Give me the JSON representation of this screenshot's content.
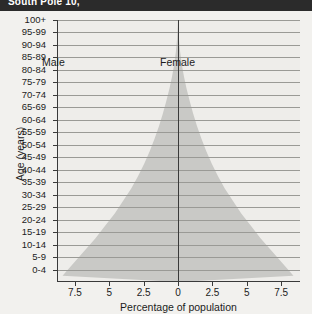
{
  "header": {
    "title": "South Pole 10,"
  },
  "chart_data": {
    "type": "bar",
    "subtype": "population-pyramid",
    "title": "",
    "xlabel": "Percentage of population",
    "ylabel": "Age (years)",
    "categories": [
      "0-4",
      "5-9",
      "10-14",
      "15-19",
      "20-24",
      "25-29",
      "30-34",
      "35-39",
      "40-44",
      "45-49",
      "50-54",
      "55-59",
      "60-64",
      "65-69",
      "70-74",
      "75-79",
      "80-84",
      "85-89",
      "90-94",
      "95-99",
      "100+"
    ],
    "series": [
      {
        "name": "Male",
        "side": "left",
        "values": [
          8.4,
          7.6,
          6.8,
          6.0,
          5.3,
          4.6,
          4.0,
          3.4,
          2.9,
          2.45,
          2.05,
          1.7,
          1.38,
          1.1,
          0.85,
          0.62,
          0.43,
          0.27,
          0.15,
          0.07,
          0.02
        ]
      },
      {
        "name": "Female",
        "side": "right",
        "values": [
          8.4,
          7.6,
          6.8,
          6.0,
          5.3,
          4.6,
          4.0,
          3.4,
          2.9,
          2.45,
          2.05,
          1.7,
          1.38,
          1.1,
          0.85,
          0.62,
          0.43,
          0.27,
          0.15,
          0.07,
          0.02
        ]
      }
    ],
    "xticks_left": [
      "7.5",
      "5",
      "2.5"
    ],
    "xtick_center": "0",
    "xticks_right": [
      "2.5",
      "5",
      "7.5"
    ],
    "xtick_values": [
      -7.5,
      -5,
      -2.5,
      0,
      2.5,
      5,
      7.5
    ],
    "xlim": [
      -8.8,
      8.8
    ],
    "grid": true,
    "legend_position": "inside-top",
    "fill_color": "#c9c9c6",
    "axis_color": "#3a3a3a",
    "grid_color": "#9a9a96",
    "background_color": "#eeedea"
  }
}
